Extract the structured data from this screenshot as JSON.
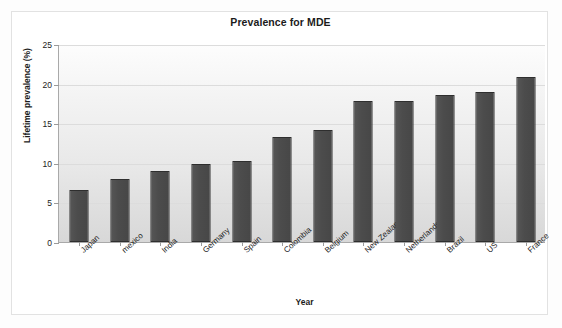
{
  "chart_data": {
    "type": "bar",
    "title": "Prevalence for MDE",
    "xlabel": "Year",
    "ylabel": "Lifetime prevalence (%)",
    "categories": [
      "Japan",
      "mexico",
      "India",
      "Germany",
      "Spain",
      "Colombia",
      "Belgium",
      "New Zealand",
      "Netherlands",
      "Brazil",
      "US",
      "France"
    ],
    "values": [
      6.6,
      8.0,
      9.0,
      9.9,
      10.2,
      13.2,
      14.1,
      17.8,
      17.8,
      18.6,
      19.0,
      20.8
    ],
    "ylim": [
      0,
      25
    ],
    "yticks": [
      0,
      5,
      10,
      15,
      20,
      25
    ],
    "ytick_labels": [
      "0",
      "5",
      "10",
      "15",
      "20",
      "25"
    ],
    "grid": true,
    "legend": "none",
    "bar_color": "#4c4c4c",
    "bar_border_color": "#2e2e2e",
    "plot_background": "#e8e8e8",
    "frame_color": "#e2e2e2"
  }
}
